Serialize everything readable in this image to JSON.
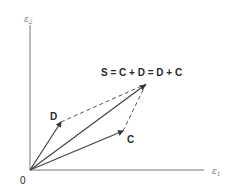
{
  "diagram": {
    "type": "vector-addition",
    "origin_label": "0",
    "axes": {
      "x_label": "ε",
      "x_subscript": "1",
      "y_label": "ε",
      "y_subscript": "2"
    },
    "vectors": [
      {
        "name": "D",
        "label": "D",
        "style": "solid-arrow"
      },
      {
        "name": "C",
        "label": "C",
        "style": "solid-arrow"
      },
      {
        "name": "S",
        "label": "S = C + D = D + C",
        "style": "solid-arrow"
      }
    ],
    "dashed_lines": [
      {
        "from": "D tip",
        "to": "S tip"
      },
      {
        "from": "C tip",
        "to": "S tip"
      }
    ],
    "colors": {
      "line": "#555555",
      "text": "#2a2a2a",
      "axis_label": "#777777"
    }
  }
}
